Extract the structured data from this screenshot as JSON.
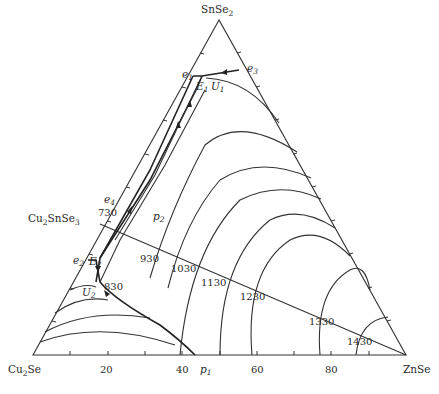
{
  "diagram": {
    "type": "ternary-phase-diagram",
    "vertices": {
      "top": {
        "main": "SnSe",
        "sub": "2"
      },
      "left": {
        "main": "Cu",
        "sub": "2",
        "rest": "Se"
      },
      "right": {
        "main": "ZnSe"
      }
    },
    "compound_on_edge": {
      "main": "Cu",
      "sub": "2",
      "rest": "SnSe",
      "sub2": "3"
    },
    "bottom_axis_ticks": [
      "20",
      "40",
      "60",
      "80"
    ],
    "isotherms": [
      "730",
      "830",
      "930",
      "1030",
      "1130",
      "1230",
      "1330",
      "1430"
    ],
    "invariant_points": [
      {
        "id": "e1",
        "main": "e",
        "sub": "1"
      },
      {
        "id": "e2",
        "main": "e",
        "sub": "2"
      },
      {
        "id": "e3",
        "main": "e",
        "sub": "3"
      },
      {
        "id": "e4",
        "main": "e",
        "sub": "4"
      },
      {
        "id": "E1",
        "main": "E",
        "sub": "1"
      },
      {
        "id": "E2",
        "main": "E",
        "sub": "2"
      },
      {
        "id": "U1",
        "main": "U",
        "sub": "1"
      },
      {
        "id": "U2",
        "main": "U",
        "sub": "2"
      },
      {
        "id": "p1",
        "main": "p",
        "sub": "1"
      },
      {
        "id": "p2",
        "main": "p",
        "sub": "2"
      }
    ]
  }
}
